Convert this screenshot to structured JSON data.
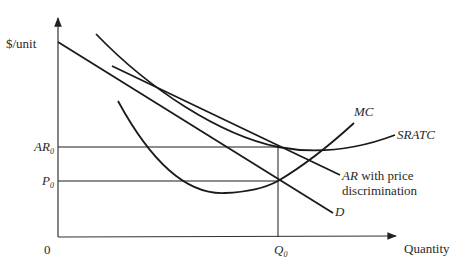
{
  "diagram": {
    "type": "economics-cost-revenue-diagram",
    "axes": {
      "y_label": "$/unit",
      "x_label": "Quantity",
      "origin_label": "0"
    },
    "reference_lines": {
      "ar0": {
        "label": "AR",
        "subscript": "0"
      },
      "p0": {
        "label": "P",
        "subscript": "0"
      },
      "q0": {
        "label": "Q",
        "subscript": "0"
      }
    },
    "curves": {
      "demand": {
        "label": "D"
      },
      "srate": {
        "label": "SRATC"
      },
      "mc": {
        "label": "MC"
      },
      "ar_discrimination": {
        "label_italic": "AR",
        "label_rest": " with price",
        "label_line2": "discrimination"
      }
    }
  }
}
